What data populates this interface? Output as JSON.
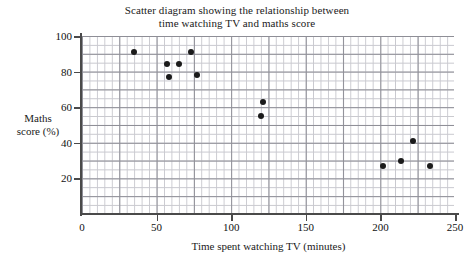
{
  "chart_data": {
    "type": "scatter",
    "title": "Scatter diagram showing the relationship between time watching TV and maths score",
    "title_lines": [
      "Scatter diagram showing the relationship between",
      "time watching TV and maths score"
    ],
    "xlabel": "Time spent watching TV (minutes)",
    "ylabel": "Maths score (%)",
    "ylabel_lines": [
      "Maths",
      "score (%)"
    ],
    "xlim": [
      0,
      250
    ],
    "ylim": [
      0,
      100
    ],
    "xticks": [
      0,
      50,
      100,
      150,
      200,
      250
    ],
    "xtick_labels": [
      "0",
      "50",
      "100",
      "150",
      "200",
      "250"
    ],
    "yticks": [
      20,
      40,
      60,
      80,
      100
    ],
    "ytick_labels": [
      "20",
      "40",
      "60",
      "80",
      "100"
    ],
    "grid": true,
    "grid_minor_step": {
      "x": 5,
      "y": 5
    },
    "grid_major_step": {
      "x": 25,
      "y": 10
    },
    "legend": null,
    "marker": "filled-circle",
    "marker_color": "#1b1b1b",
    "points": [
      {
        "x": 35,
        "y": 91
      },
      {
        "x": 57,
        "y": 84
      },
      {
        "x": 65,
        "y": 84
      },
      {
        "x": 58,
        "y": 77
      },
      {
        "x": 73,
        "y": 91
      },
      {
        "x": 77,
        "y": 78
      },
      {
        "x": 121,
        "y": 63
      },
      {
        "x": 120,
        "y": 55
      },
      {
        "x": 202,
        "y": 27
      },
      {
        "x": 214,
        "y": 30
      },
      {
        "x": 222,
        "y": 41
      },
      {
        "x": 233,
        "y": 27
      }
    ]
  }
}
